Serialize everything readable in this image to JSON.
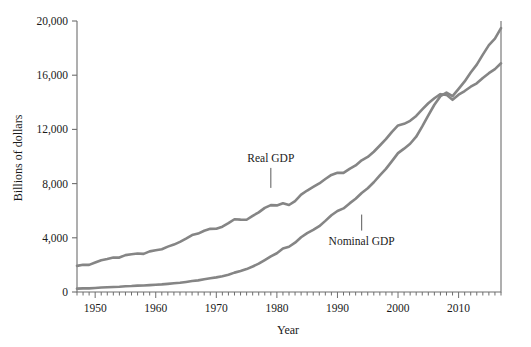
{
  "chart_data": {
    "type": "line",
    "title": "",
    "xlabel": "Year",
    "ylabel": "Billions of dollars",
    "xlim": [
      1947,
      2017
    ],
    "ylim": [
      0,
      20000
    ],
    "grid": false,
    "legend_position": "inline-annotations",
    "y_ticks": [
      0,
      4000,
      8000,
      12000,
      16000,
      20000
    ],
    "y_tick_labels": [
      "0",
      "4,000",
      "8,000",
      "12,000",
      "16,000",
      "20,000"
    ],
    "x_ticks": [
      1950,
      1960,
      1970,
      1980,
      1990,
      2000,
      2010
    ],
    "x_tick_labels": [
      "1950",
      "1960",
      "1970",
      "1980",
      "1990",
      "2000",
      "2010"
    ],
    "x_minor_tick_interval": 1,
    "line_color": "#858585",
    "axis_color": "#6e6e6e",
    "series": [
      {
        "name": "Real GDP",
        "label_x": 1979,
        "label_y": 9600,
        "x": [
          1947,
          1948,
          1949,
          1950,
          1951,
          1952,
          1953,
          1954,
          1955,
          1956,
          1957,
          1958,
          1959,
          1960,
          1961,
          1962,
          1963,
          1964,
          1965,
          1966,
          1967,
          1968,
          1969,
          1970,
          1971,
          1972,
          1973,
          1974,
          1975,
          1976,
          1977,
          1978,
          1979,
          1980,
          1981,
          1982,
          1983,
          1984,
          1985,
          1986,
          1987,
          1988,
          1989,
          1990,
          1991,
          1992,
          1993,
          1994,
          1995,
          1996,
          1997,
          1998,
          1999,
          2000,
          2001,
          2002,
          2003,
          2004,
          2005,
          2006,
          2007,
          2008,
          2009,
          2010,
          2011,
          2012,
          2013,
          2014,
          2015,
          2016,
          2017
        ],
        "values": [
          1930,
          2010,
          2000,
          2180,
          2350,
          2440,
          2550,
          2540,
          2720,
          2780,
          2840,
          2810,
          3000,
          3080,
          3160,
          3350,
          3500,
          3700,
          3940,
          4200,
          4310,
          4520,
          4660,
          4670,
          4820,
          5080,
          5370,
          5340,
          5330,
          5620,
          5880,
          6210,
          6410,
          6390,
          6550,
          6420,
          6710,
          7190,
          7490,
          7750,
          8010,
          8340,
          8640,
          8800,
          8790,
          9090,
          9340,
          9720,
          9970,
          10350,
          10810,
          11280,
          11820,
          12290,
          12410,
          12630,
          12990,
          13480,
          13930,
          14300,
          14600,
          14550,
          14180,
          14560,
          14830,
          15150,
          15400,
          15800,
          16150,
          16450,
          16880
        ]
      },
      {
        "name": "Nominal GDP",
        "label_x": 1994,
        "label_y": 3500,
        "x": [
          1947,
          1948,
          1949,
          1950,
          1951,
          1952,
          1953,
          1954,
          1955,
          1956,
          1957,
          1958,
          1959,
          1960,
          1961,
          1962,
          1963,
          1964,
          1965,
          1966,
          1967,
          1968,
          1969,
          1970,
          1971,
          1972,
          1973,
          1974,
          1975,
          1976,
          1977,
          1978,
          1979,
          1980,
          1981,
          1982,
          1983,
          1984,
          1985,
          1986,
          1987,
          1988,
          1989,
          1990,
          1991,
          1992,
          1993,
          1994,
          1995,
          1996,
          1997,
          1998,
          1999,
          2000,
          2001,
          2002,
          2003,
          2004,
          2005,
          2006,
          2007,
          2008,
          2009,
          2010,
          2011,
          2012,
          2013,
          2014,
          2015,
          2016,
          2017
        ],
        "values": [
          250,
          270,
          270,
          300,
          330,
          350,
          370,
          390,
          420,
          440,
          470,
          480,
          510,
          540,
          560,
          600,
          640,
          680,
          740,
          810,
          860,
          940,
          1020,
          1080,
          1170,
          1280,
          1430,
          1550,
          1690,
          1880,
          2090,
          2360,
          2630,
          2860,
          3210,
          3340,
          3640,
          4040,
          4340,
          4580,
          4860,
          5250,
          5660,
          5980,
          6170,
          6540,
          6880,
          7310,
          7660,
          8100,
          8610,
          9090,
          9660,
          10250,
          10580,
          10940,
          11460,
          12220,
          13040,
          13820,
          14450,
          14710,
          14450,
          14990,
          15540,
          16200,
          16780,
          17520,
          18220,
          18700,
          19480
        ]
      }
    ]
  }
}
